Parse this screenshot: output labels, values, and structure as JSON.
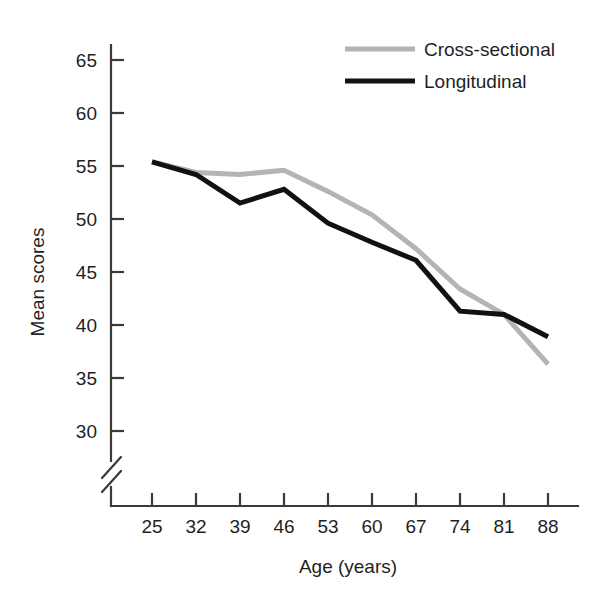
{
  "chart_data": {
    "type": "line",
    "title": "",
    "xlabel": "Age (years)",
    "ylabel": "Mean scores",
    "x": [
      25,
      32,
      39,
      46,
      53,
      60,
      67,
      74,
      81,
      88
    ],
    "xtick_labels": [
      "25",
      "32",
      "39",
      "46",
      "53",
      "60",
      "67",
      "74",
      "81",
      "88"
    ],
    "ytick_labels": [
      "30",
      "35",
      "40",
      "45",
      "50",
      "55",
      "60",
      "65"
    ],
    "yticks": [
      30,
      35,
      40,
      45,
      50,
      55,
      60,
      65
    ],
    "ylim": [
      28.5,
      66.5
    ],
    "xlim": [
      25,
      88
    ],
    "grid": false,
    "axis_break": true,
    "axis_break_axis": "y",
    "legend_position": "top-right",
    "series": [
      {
        "name": "Cross-sectional",
        "color": "#b4b4b4",
        "values": [
          55.4,
          54.4,
          54.2,
          54.6,
          52.6,
          50.4,
          47.2,
          43.4,
          41.0,
          36.3
        ]
      },
      {
        "name": "Longitudinal",
        "color": "#111111",
        "values": [
          55.4,
          54.2,
          51.5,
          52.8,
          49.6,
          47.8,
          46.1,
          41.3,
          41.0,
          38.9
        ]
      }
    ]
  },
  "legend": {
    "entries": [
      {
        "label": "Cross-sectional",
        "color": "#b4b4b4"
      },
      {
        "label": "Longitudinal",
        "color": "#111111"
      }
    ]
  },
  "axes": {
    "x_title": "Age (years)",
    "y_title": "Mean scores"
  },
  "colors": {
    "cross_sectional": "#b4b4b4",
    "longitudinal": "#111111",
    "axis": "#3a3a3a",
    "background": "#ffffff"
  }
}
